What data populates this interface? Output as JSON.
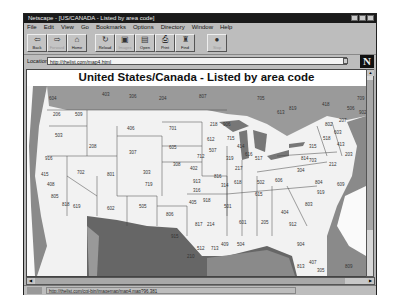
{
  "window": {
    "title": "Netscape - [US/CANADA - Listed by area code]"
  },
  "menu": [
    "File",
    "Edit",
    "View",
    "Go",
    "Bookmarks",
    "Options",
    "Directory",
    "Window",
    "Help"
  ],
  "toolbar": [
    {
      "label": "Back",
      "icon": "back-icon",
      "glyph": "⇦",
      "enabled": true
    },
    {
      "label": "Forward",
      "icon": "forward-icon",
      "glyph": "⇨",
      "enabled": false
    },
    {
      "label": "Home",
      "icon": "home-icon",
      "glyph": "⌂",
      "enabled": true
    },
    {
      "label": "Reload",
      "icon": "reload-icon",
      "glyph": "↻",
      "enabled": true
    },
    {
      "label": "Images",
      "icon": "images-icon",
      "glyph": "▣",
      "enabled": false
    },
    {
      "label": "Open",
      "icon": "open-icon",
      "glyph": "▤",
      "enabled": true
    },
    {
      "label": "Print",
      "icon": "print-icon",
      "glyph": "⎙",
      "enabled": true
    },
    {
      "label": "Find",
      "icon": "find-icon",
      "glyph": "♜",
      "enabled": true
    },
    {
      "label": "Stop",
      "icon": "stop-icon",
      "glyph": "●",
      "enabled": false
    }
  ],
  "location": {
    "label": "Location:",
    "url": "http://thelist.com/map4.html"
  },
  "page": {
    "title": "United States/Canada - Listed by area code",
    "area_codes": [
      {
        "code": "604",
        "x": 22,
        "y": 14
      },
      {
        "code": "403",
        "x": 75,
        "y": 10
      },
      {
        "code": "306",
        "x": 102,
        "y": 12
      },
      {
        "code": "204",
        "x": 132,
        "y": 14
      },
      {
        "code": "807",
        "x": 172,
        "y": 12
      },
      {
        "code": "705",
        "x": 230,
        "y": 14
      },
      {
        "code": "206",
        "x": 26,
        "y": 30
      },
      {
        "code": "509",
        "x": 48,
        "y": 30
      },
      {
        "code": "406",
        "x": 100,
        "y": 44
      },
      {
        "code": "701",
        "x": 142,
        "y": 44
      },
      {
        "code": "218",
        "x": 183,
        "y": 40
      },
      {
        "code": "503",
        "x": 28,
        "y": 51
      },
      {
        "code": "208",
        "x": 62,
        "y": 62
      },
      {
        "code": "605",
        "x": 142,
        "y": 63
      },
      {
        "code": "612",
        "x": 180,
        "y": 55
      },
      {
        "code": "715",
        "x": 200,
        "y": 54
      },
      {
        "code": "307",
        "x": 102,
        "y": 68
      },
      {
        "code": "507",
        "x": 182,
        "y": 66
      },
      {
        "code": "517",
        "x": 228,
        "y": 74
      },
      {
        "code": "916",
        "x": 18,
        "y": 74
      },
      {
        "code": "702",
        "x": 50,
        "y": 88
      },
      {
        "code": "801",
        "x": 80,
        "y": 90
      },
      {
        "code": "303",
        "x": 116,
        "y": 88
      },
      {
        "code": "308",
        "x": 146,
        "y": 80
      },
      {
        "code": "402",
        "x": 163,
        "y": 84
      },
      {
        "code": "712",
        "x": 170,
        "y": 72
      },
      {
        "code": "319",
        "x": 199,
        "y": 74
      },
      {
        "code": "415",
        "x": 14,
        "y": 90
      },
      {
        "code": "408",
        "x": 20,
        "y": 100
      },
      {
        "code": "719",
        "x": 118,
        "y": 100
      },
      {
        "code": "913",
        "x": 166,
        "y": 97
      },
      {
        "code": "316",
        "x": 166,
        "y": 106
      },
      {
        "code": "816",
        "x": 187,
        "y": 92
      },
      {
        "code": "314",
        "x": 194,
        "y": 101
      },
      {
        "code": "618",
        "x": 207,
        "y": 98
      },
      {
        "code": "217",
        "x": 208,
        "y": 84
      },
      {
        "code": "805",
        "x": 24,
        "y": 112
      },
      {
        "code": "818",
        "x": 35,
        "y": 120
      },
      {
        "code": "619",
        "x": 46,
        "y": 122
      },
      {
        "code": "602",
        "x": 80,
        "y": 124
      },
      {
        "code": "505",
        "x": 112,
        "y": 122
      },
      {
        "code": "806",
        "x": 139,
        "y": 130
      },
      {
        "code": "405",
        "x": 162,
        "y": 118
      },
      {
        "code": "918",
        "x": 176,
        "y": 116
      },
      {
        "code": "501",
        "x": 197,
        "y": 122
      },
      {
        "code": "601",
        "x": 212,
        "y": 138
      },
      {
        "code": "205",
        "x": 234,
        "y": 138
      },
      {
        "code": "912",
        "x": 262,
        "y": 140
      },
      {
        "code": "404",
        "x": 254,
        "y": 128
      },
      {
        "code": "803",
        "x": 278,
        "y": 120
      },
      {
        "code": "615",
        "x": 228,
        "y": 110
      },
      {
        "code": "502",
        "x": 230,
        "y": 98
      },
      {
        "code": "606",
        "x": 248,
        "y": 96
      },
      {
        "code": "304",
        "x": 270,
        "y": 86
      },
      {
        "code": "804",
        "x": 288,
        "y": 98
      },
      {
        "code": "919",
        "x": 290,
        "y": 108
      },
      {
        "code": "703",
        "x": 282,
        "y": 76
      },
      {
        "code": "814",
        "x": 274,
        "y": 74
      },
      {
        "code": "315",
        "x": 282,
        "y": 62
      },
      {
        "code": "518",
        "x": 296,
        "y": 54
      },
      {
        "code": "802",
        "x": 298,
        "y": 40
      },
      {
        "code": "207",
        "x": 312,
        "y": 36
      },
      {
        "code": "603",
        "x": 307,
        "y": 48
      },
      {
        "code": "413",
        "x": 310,
        "y": 60
      },
      {
        "code": "203",
        "x": 318,
        "y": 70
      },
      {
        "code": "212",
        "x": 302,
        "y": 80
      },
      {
        "code": "609",
        "x": 310,
        "y": 100
      },
      {
        "code": "915",
        "x": 144,
        "y": 152
      },
      {
        "code": "817",
        "x": 168,
        "y": 140
      },
      {
        "code": "214",
        "x": 180,
        "y": 140
      },
      {
        "code": "713",
        "x": 184,
        "y": 164
      },
      {
        "code": "504",
        "x": 210,
        "y": 160
      },
      {
        "code": "409",
        "x": 194,
        "y": 160
      },
      {
        "code": "512",
        "x": 170,
        "y": 164
      },
      {
        "code": "210",
        "x": 160,
        "y": 172
      },
      {
        "code": "904",
        "x": 270,
        "y": 160
      },
      {
        "code": "407",
        "x": 282,
        "y": 178
      },
      {
        "code": "813",
        "x": 270,
        "y": 182
      },
      {
        "code": "305",
        "x": 290,
        "y": 186
      },
      {
        "code": "809",
        "x": 318,
        "y": 182
      },
      {
        "code": "616",
        "x": 218,
        "y": 70
      },
      {
        "code": "414",
        "x": 210,
        "y": 62
      },
      {
        "code": "906",
        "x": 196,
        "y": 40
      },
      {
        "code": "613",
        "x": 250,
        "y": 28
      },
      {
        "code": "819",
        "x": 262,
        "y": 24
      },
      {
        "code": "418",
        "x": 295,
        "y": 20
      },
      {
        "code": "506",
        "x": 320,
        "y": 24
      },
      {
        "code": "902",
        "x": 332,
        "y": 28
      },
      {
        "code": "709",
        "x": 330,
        "y": 14
      }
    ]
  },
  "status": {
    "text": "http://thelist.com/cgi-bin/imagemap/map4.map?96,381"
  }
}
